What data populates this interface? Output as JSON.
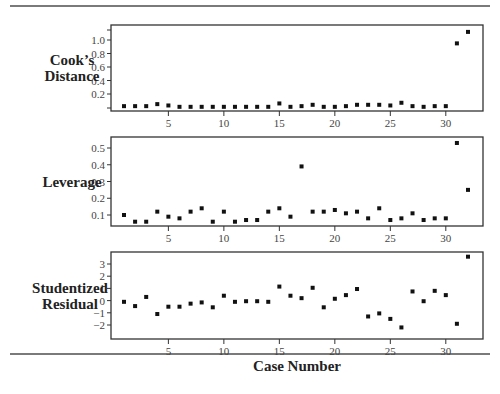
{
  "chart_data": [
    {
      "type": "scatter",
      "title": "",
      "ylabel": "Cook's Distance",
      "xlabel": "",
      "x": [
        1,
        2,
        3,
        4,
        5,
        6,
        7,
        8,
        9,
        10,
        11,
        12,
        13,
        14,
        15,
        16,
        17,
        18,
        19,
        20,
        21,
        22,
        23,
        24,
        25,
        26,
        27,
        28,
        29,
        30,
        31,
        32
      ],
      "values": [
        0.02,
        0.02,
        0.02,
        0.05,
        0.03,
        0.01,
        0.01,
        0.01,
        0.01,
        0.01,
        0.01,
        0.01,
        0.01,
        0.01,
        0.06,
        0.01,
        0.02,
        0.04,
        0.01,
        0.01,
        0.02,
        0.04,
        0.04,
        0.04,
        0.03,
        0.07,
        0.02,
        0.01,
        0.02,
        0.02,
        0.95,
        1.12
      ],
      "yticks": [
        0.2,
        0.4,
        0.6,
        0.8,
        1.0
      ],
      "ylim": [
        0,
        1.2
      ],
      "grid": false
    },
    {
      "type": "scatter",
      "title": "",
      "ylabel": "Leverage",
      "xlabel": "",
      "x": [
        1,
        2,
        3,
        4,
        5,
        6,
        7,
        8,
        9,
        10,
        11,
        12,
        13,
        14,
        15,
        16,
        17,
        18,
        19,
        20,
        21,
        22,
        23,
        24,
        25,
        26,
        27,
        28,
        29,
        30,
        31,
        32
      ],
      "values": [
        0.1,
        0.06,
        0.06,
        0.12,
        0.09,
        0.08,
        0.12,
        0.14,
        0.06,
        0.12,
        0.06,
        0.07,
        0.07,
        0.12,
        0.14,
        0.09,
        0.39,
        0.12,
        0.12,
        0.13,
        0.11,
        0.12,
        0.08,
        0.14,
        0.07,
        0.08,
        0.11,
        0.07,
        0.08,
        0.08,
        0.53,
        0.25
      ],
      "yticks": [
        0.1,
        0.2,
        0.3,
        0.4,
        0.5
      ],
      "ylim": [
        0.04,
        0.56
      ],
      "grid": false
    },
    {
      "type": "scatter",
      "title": "",
      "ylabel": "Studentized Residual",
      "xlabel": "Case Number",
      "x": [
        1,
        2,
        3,
        4,
        5,
        6,
        7,
        8,
        9,
        10,
        11,
        12,
        13,
        14,
        15,
        16,
        17,
        18,
        19,
        20,
        21,
        22,
        23,
        24,
        25,
        26,
        27,
        28,
        29,
        30,
        31,
        32
      ],
      "values": [
        -0.1,
        -0.45,
        0.3,
        -1.1,
        -0.5,
        -0.5,
        -0.25,
        -0.15,
        -0.55,
        0.4,
        -0.1,
        -0.05,
        -0.05,
        -0.1,
        1.15,
        0.4,
        0.2,
        1.05,
        -0.55,
        0.15,
        0.45,
        0.95,
        -1.3,
        -1.05,
        -1.5,
        -2.2,
        0.75,
        -0.05,
        0.8,
        0.45,
        -1.9,
        3.6
      ],
      "yticks": [
        -2,
        -1,
        0,
        1,
        2,
        3
      ],
      "ylim": [
        -2.3,
        3.9
      ],
      "xticks": [
        5,
        10,
        15,
        20,
        25,
        30
      ],
      "grid": false
    }
  ],
  "panels": [
    {
      "label_lines": [
        "Cook’s",
        "Distance"
      ],
      "tick_labels": [
        "0.2",
        "0.4",
        "0.6",
        "0.8",
        "1.0"
      ]
    },
    {
      "label_lines": [
        "Leverage"
      ],
      "tick_labels": [
        "0.1",
        "0.2",
        "0.3",
        "0.4",
        "0.5"
      ]
    },
    {
      "label_lines": [
        "Studentized",
        "Residual"
      ],
      "tick_labels": [
        "−2",
        "−1",
        "0",
        "1",
        "2",
        "3"
      ]
    }
  ],
  "x_tick_labels": [
    "5",
    "10",
    "15",
    "20",
    "25",
    "30"
  ],
  "x_axis_title": "Case Number"
}
